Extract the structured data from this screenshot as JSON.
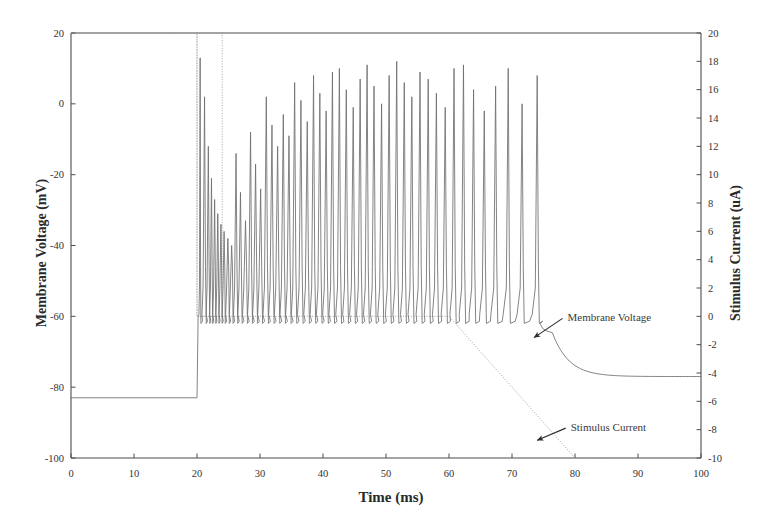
{
  "chart_data": {
    "type": "line",
    "title": "",
    "xlabel": "Time (ms)",
    "ylabel": "Membrane Voltage (mV)",
    "y2label": "Stimulus Current (uA)",
    "xlim": [
      0,
      100
    ],
    "ylim": [
      -100,
      20
    ],
    "y2lim": [
      -10,
      20
    ],
    "grid": false,
    "legend": "none",
    "xticks": [
      0,
      10,
      20,
      30,
      40,
      50,
      60,
      70,
      80,
      90,
      100
    ],
    "xticklabels": [
      "0",
      "10",
      "20",
      "30",
      "40",
      "50",
      "60",
      "70",
      "80",
      "90",
      "100"
    ],
    "yticks": [
      20,
      0,
      -20,
      -40,
      -60,
      -80,
      -100
    ],
    "yticklabels": [
      "20",
      "0",
      "-20",
      "-40",
      "-60",
      "-80",
      "-100"
    ],
    "y2ticks": [
      20,
      18,
      16,
      14,
      12,
      10,
      8,
      6,
      4,
      2,
      0,
      -2,
      -4,
      -6,
      -8,
      -10
    ],
    "y2ticklabels": [
      "20",
      "18",
      "16",
      "14",
      "12",
      "10",
      "8",
      "6",
      "4",
      "2",
      "0",
      "-2",
      "-4",
      "-6",
      "-8",
      "-10"
    ],
    "series": [
      {
        "name": "Membrane Voltage",
        "axis": "left",
        "color": "#6e6e6e",
        "style": "solid",
        "resting_mV": -83,
        "stimulus_onset_ms": 20,
        "spike_train_start_ms": 20.4,
        "spike_train_end_ms": 75.5,
        "spike_peak_range_mV": [
          5,
          13
        ],
        "trough_mV": -62,
        "final_steady_mV": -77,
        "spike_times_ms": [
          20.5,
          21.2,
          21.8,
          22.3,
          22.8,
          23.3,
          23.8,
          24.3,
          24.9,
          25.5,
          26.2,
          26.9,
          27.7,
          28.5,
          29.3,
          30.1,
          31.0,
          31.9,
          32.8,
          33.7,
          34.6,
          35.5,
          36.5,
          37.5,
          38.5,
          39.5,
          40.5,
          41.5,
          42.6,
          43.7,
          44.8,
          45.9,
          47.0,
          48.1,
          49.3,
          50.5,
          51.7,
          52.9,
          54.1,
          55.4,
          56.7,
          58.0,
          59.4,
          60.8,
          62.3,
          63.9,
          65.6,
          67.4,
          69.4,
          71.6,
          74.0
        ],
        "spike_peaks_mV": [
          13,
          2,
          -12,
          -21,
          -27,
          -31,
          -34,
          -36,
          -38,
          -40,
          -14,
          -25,
          -33,
          -8,
          -17,
          -24,
          2,
          -6,
          -12,
          -3,
          -9,
          6,
          1,
          -5,
          8,
          3,
          -2,
          9,
          10,
          4,
          -1,
          7,
          11,
          5,
          0,
          8,
          12,
          6,
          2,
          9,
          7,
          3,
          -1,
          10,
          11,
          4,
          -2,
          5,
          10,
          0,
          8
        ]
      },
      {
        "name": "Stimulus Current",
        "axis": "right",
        "color": "#9a9a9a",
        "style": "dotted",
        "points": [
          {
            "t": 0,
            "i": 20
          },
          {
            "t": 20,
            "i": 20
          },
          {
            "t": 20,
            "i": 0
          },
          {
            "t": 24,
            "i": 0
          },
          {
            "t": 24,
            "i": 20
          },
          {
            "t": 20,
            "i": 20
          },
          {
            "t": 20,
            "i": 0
          },
          {
            "t": 60,
            "i": 0
          },
          {
            "t": 80,
            "i": -10
          },
          {
            "t": 100,
            "i": -10
          }
        ],
        "description": "Vertical dotted markers at t=20 ms and t=24 ms, a flat 0 uA plateau from 24 to 60 ms, then a linear ramp down to -10 uA at t=80 ms."
      }
    ],
    "annotations": [
      {
        "name": "membrane-voltage-annotation",
        "text": "Membrane Voltage",
        "label_x_ms": 78.5,
        "label_y_mV": -60,
        "arrow_to_x_ms": 73.5,
        "arrow_to_y_mV": -66
      },
      {
        "name": "stimulus-current-annotation",
        "text": "Stimulus Current",
        "label_x_ms": 79,
        "label_y_mV": -91,
        "arrow_to_x_ms": 74,
        "arrow_to_y_mV": -95
      }
    ]
  },
  "colors": {
    "background": "#ffffff",
    "frame": "#4d4d4d",
    "voltage_trace": "#6e6e6e",
    "stimulus_trace": "#9a9a9a",
    "text": "#333333",
    "arrow": "#2b2b2b"
  }
}
